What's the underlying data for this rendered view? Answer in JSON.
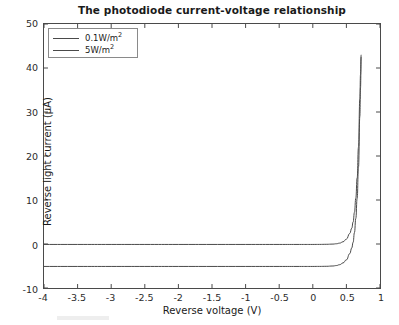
{
  "chart_data": {
    "type": "line",
    "title": "The photodiode current-voltage relationship",
    "xlabel": "Reverse voltage (V)",
    "ylabel": "Reverse light current (μA)",
    "xlim": [
      -4,
      1
    ],
    "ylim": [
      -10,
      50
    ],
    "xticks": [
      -4,
      -3.5,
      -3,
      -2.5,
      -2,
      -1.5,
      -1,
      -0.5,
      0,
      0.5,
      1
    ],
    "xtick_labels": [
      "-4",
      "-3.5",
      "-3",
      "-2.5",
      "-2",
      "-1.5",
      "-1",
      "-0.5",
      "0",
      "0.5",
      "1"
    ],
    "yticks": [
      -10,
      0,
      10,
      20,
      30,
      40,
      50
    ],
    "ytick_labels": [
      "-10",
      "0",
      "10",
      "20",
      "30",
      "40",
      "50"
    ],
    "grid": false,
    "legend_position": "upper left",
    "line_color": "#4a4a4a",
    "series": [
      {
        "name": "0.1W/m²",
        "superscript_base": "0.1W/m",
        "superscript_exp": "2",
        "saturation_current": 0,
        "x": [
          -4,
          -3.5,
          -3,
          -2.5,
          -2,
          -1.5,
          -1,
          -0.5,
          -0.2,
          0,
          0.1,
          0.2,
          0.3,
          0.35,
          0.4,
          0.45,
          0.5,
          0.55,
          0.58,
          0.6,
          0.62,
          0.64,
          0.66,
          0.68,
          0.7,
          0.71,
          0.72
        ],
        "y": [
          -0.1,
          -0.1,
          -0.1,
          -0.1,
          -0.1,
          -0.1,
          -0.1,
          -0.1,
          -0.1,
          -0.1,
          -0.09,
          -0.07,
          -0.02,
          0.05,
          0.2,
          0.5,
          1.1,
          2.4,
          3.6,
          5.0,
          7.2,
          10.4,
          15.0,
          22.0,
          33.0,
          38.5,
          43.0
        ]
      },
      {
        "name": "5W/m²",
        "superscript_base": "5W/m",
        "superscript_exp": "2",
        "saturation_current": -5,
        "x": [
          -4,
          -3.5,
          -3,
          -2.5,
          -2,
          -1.5,
          -1,
          -0.5,
          -0.2,
          0,
          0.1,
          0.2,
          0.3,
          0.35,
          0.4,
          0.45,
          0.5,
          0.55,
          0.58,
          0.6,
          0.62,
          0.64,
          0.66,
          0.68,
          0.7,
          0.71,
          0.72
        ],
        "y": [
          -5.1,
          -5.1,
          -5.1,
          -5.1,
          -5.1,
          -5.1,
          -5.1,
          -5.1,
          -5.1,
          -5.1,
          -5.09,
          -5.07,
          -5.0,
          -4.9,
          -4.7,
          -4.3,
          -3.6,
          -2.2,
          -0.9,
          0.4,
          2.6,
          5.8,
          10.4,
          17.5,
          29.0,
          35.5,
          42.5
        ]
      }
    ]
  },
  "legend": {
    "items": [
      {
        "label": "0.1W/m",
        "exp": "2"
      },
      {
        "label": "5W/m",
        "exp": "2"
      }
    ]
  }
}
